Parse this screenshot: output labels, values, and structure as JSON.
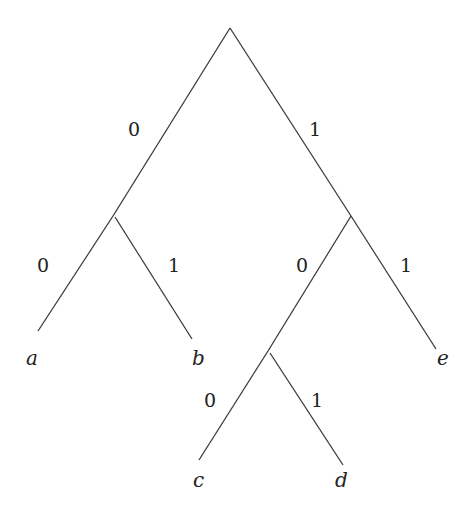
{
  "diagram": {
    "type": "binary-code-tree",
    "stroke_color": "#3a3a3a",
    "nodes": {
      "root": {
        "x": 230,
        "y": 28
      },
      "n0": {
        "x": 114,
        "y": 214
      },
      "n1": {
        "x": 351,
        "y": 216
      },
      "n10": {
        "x": 268,
        "y": 351
      }
    },
    "edges": [
      {
        "id": "root-n0",
        "x1": 230,
        "y1": 28,
        "x2": 113,
        "y2": 216,
        "bit": "0",
        "label_x": 128,
        "label_y": 136
      },
      {
        "id": "root-n1",
        "x1": 230,
        "y1": 28,
        "x2": 351,
        "y2": 216,
        "bit": "1",
        "label_x": 309,
        "label_y": 136
      },
      {
        "id": "n0-a",
        "x1": 113,
        "y1": 216,
        "x2": 38,
        "y2": 331,
        "bit": "0",
        "label_x": 37,
        "label_y": 272
      },
      {
        "id": "n0-b",
        "x1": 115,
        "y1": 217,
        "x2": 192,
        "y2": 339,
        "bit": "1",
        "label_x": 168,
        "label_y": 272
      },
      {
        "id": "n1-n10",
        "x1": 351,
        "y1": 216,
        "x2": 268,
        "y2": 351,
        "bit": "0",
        "label_x": 296,
        "label_y": 272
      },
      {
        "id": "n1-e",
        "x1": 351,
        "y1": 216,
        "x2": 436,
        "y2": 349,
        "bit": "1",
        "label_x": 400,
        "label_y": 272
      },
      {
        "id": "n10-c",
        "x1": 268,
        "y1": 351,
        "x2": 199,
        "y2": 460,
        "bit": "0",
        "label_x": 204,
        "label_y": 407
      },
      {
        "id": "n10-d",
        "x1": 270,
        "y1": 353,
        "x2": 343,
        "y2": 465,
        "bit": "1",
        "label_x": 311,
        "label_y": 407
      }
    ],
    "leaves": [
      {
        "id": "a",
        "label": "a",
        "x": 26,
        "y": 365
      },
      {
        "id": "b",
        "label": "b",
        "x": 192,
        "y": 365
      },
      {
        "id": "e",
        "label": "e",
        "x": 437,
        "y": 365
      },
      {
        "id": "c",
        "label": "c",
        "x": 193,
        "y": 487
      },
      {
        "id": "d",
        "label": "d",
        "x": 335,
        "y": 487
      }
    ]
  }
}
